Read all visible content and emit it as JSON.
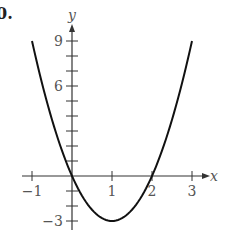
{
  "part_label": "0.",
  "chart_data": {
    "type": "line",
    "title": "",
    "xlabel": "x",
    "ylabel": "y",
    "function": "y = 3x^2 - 6x",
    "vertex": [
      1,
      -3
    ],
    "x_intercepts": [
      0,
      2
    ],
    "xlim": [
      -1,
      3
    ],
    "ylim": [
      -3,
      9
    ],
    "x_ticks": [
      -1,
      0,
      1,
      2,
      3
    ],
    "x_tick_labels": [
      "−1",
      "1",
      "2",
      "3"
    ],
    "x_tick_label_values": [
      -1,
      1,
      2,
      3
    ],
    "y_ticks": [
      -3,
      -2,
      -1,
      0,
      1,
      2,
      3,
      4,
      5,
      6,
      7,
      8,
      9
    ],
    "y_tick_labels": [
      "9",
      "6",
      "−3"
    ],
    "y_tick_label_values": [
      9,
      6,
      -3
    ],
    "grid": false,
    "legend": null,
    "series": [
      {
        "name": "parabola",
        "x": [
          -1,
          -0.5,
          0,
          0.5,
          1,
          1.5,
          2,
          2.5,
          3
        ],
        "values": [
          9,
          3.75,
          0,
          -2.25,
          -3,
          -2.25,
          0,
          3.75,
          9
        ]
      }
    ],
    "colors": {
      "curve": "#111111",
      "axis": "#333333",
      "label": "#555555"
    }
  }
}
